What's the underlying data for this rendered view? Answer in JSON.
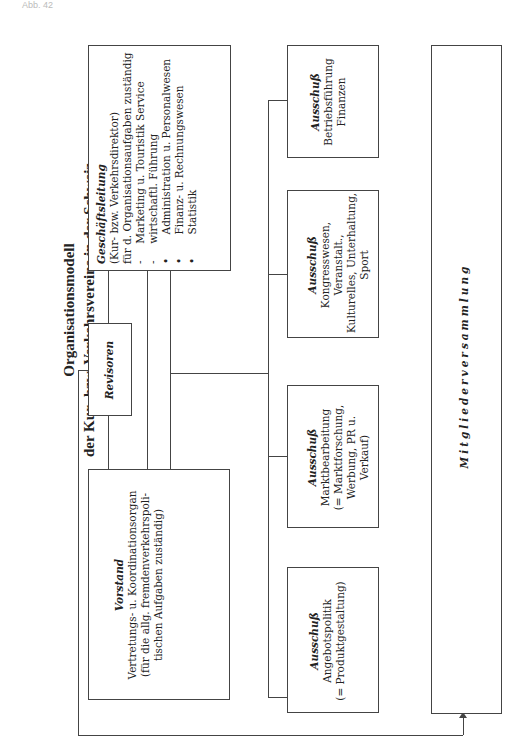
{
  "header": {
    "label": "Abb. 42"
  },
  "title": {
    "line1": "Organisationsmodell",
    "line2": "der Kur- bzw. Verkehrsvereine in der Schweiz"
  },
  "boxes": {
    "geschaeftsleitung": {
      "heading": "Geschäftsleitung",
      "lines": [
        "(Kur- bzw. Verkehrsdirektor)",
        "für d. Organisationsaufgaben zuständig",
        "-     Marketing u. Touristik Service",
        "-     wirtschaftl. Führung",
        "•       Administration u. Personalwesen",
        "•       Finanz- u. Rechnungswesen",
        "•       Statistik"
      ]
    },
    "revisoren": {
      "heading": "Revisoren"
    },
    "vorstand": {
      "heading": "Vorstand",
      "lines": [
        "Vertretungs- u. Koordinationsorgan",
        "(für die allg. fremdenverkehrspoli-",
        "tischen Aufgaben zuständig)"
      ]
    },
    "ausschuss_betrieb": {
      "heading": "Ausschuß",
      "lines": [
        "Betriebsführung",
        "Finanzen"
      ]
    },
    "ausschuss_kongress": {
      "heading": "Ausschuß",
      "lines": [
        "Kongresswesen,",
        "Veranstalt.,",
        "Kulturelles, Unterhaltung,",
        "Sport"
      ]
    },
    "ausschuss_markt": {
      "heading": "Ausschuß",
      "lines": [
        "Marktbearbeitung",
        "(= Marktforschung,",
        "Werbung, PR u.",
        "Verkauf)"
      ]
    },
    "ausschuss_angebot": {
      "heading": "Ausschuß",
      "lines": [
        "Angebotspolitik",
        "(= Produktgestaltung)"
      ]
    },
    "mitgliederversammlung": {
      "heading": "Mitgliederversammlung"
    }
  },
  "colors": {
    "line": "#444444",
    "text": "#222222",
    "background": "#ffffff"
  }
}
